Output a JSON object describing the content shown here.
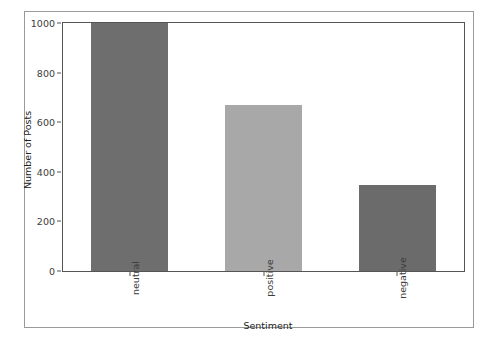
{
  "chart_data": {
    "type": "bar",
    "title": "",
    "categories": [
      "neutral",
      "positive",
      "negative"
    ],
    "values": [
      1000,
      670,
      348
    ],
    "xlabel": "Sentiment",
    "ylabel": "Number of Posts",
    "ylim": [
      0,
      1000
    ],
    "yticks": [
      0,
      200,
      400,
      600,
      800,
      1000
    ],
    "ytick_labels": [
      "0",
      "200",
      "400",
      "600",
      "800",
      "1000"
    ],
    "grid": false,
    "legend": null,
    "bar_colors": [
      "#6e6e6e",
      "#a8a8a8",
      "#6b6b6b"
    ],
    "axes_color": "#555555",
    "frame_color": "#9a9a9a",
    "background": "#ffffff",
    "xtick_rotation": 90
  }
}
